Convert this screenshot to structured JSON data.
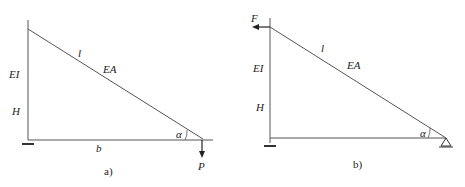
{
  "diagrams": [
    {
      "id": "a",
      "caption": "a)",
      "labels": {
        "column_stiffness": "EI",
        "column_height": "H",
        "bar_length": "l",
        "bar_stiffness": "EA",
        "base_length": "b",
        "angle": "α",
        "load": "P"
      },
      "load": {
        "name": "P",
        "direction": "down",
        "location": "right end"
      },
      "supports": [
        "fixed-base at left",
        "free end at right"
      ]
    },
    {
      "id": "b",
      "caption": "b)",
      "labels": {
        "column_stiffness": "EI",
        "column_height": "H",
        "bar_length": "l",
        "bar_stiffness": "EA",
        "angle": "α",
        "load": "F"
      },
      "load": {
        "name": "F",
        "direction": "left",
        "location": "top of column"
      },
      "supports": [
        "fixed-base at left",
        "pin support at right"
      ]
    }
  ],
  "colors": {
    "line": "#555555",
    "text": "#222222"
  }
}
